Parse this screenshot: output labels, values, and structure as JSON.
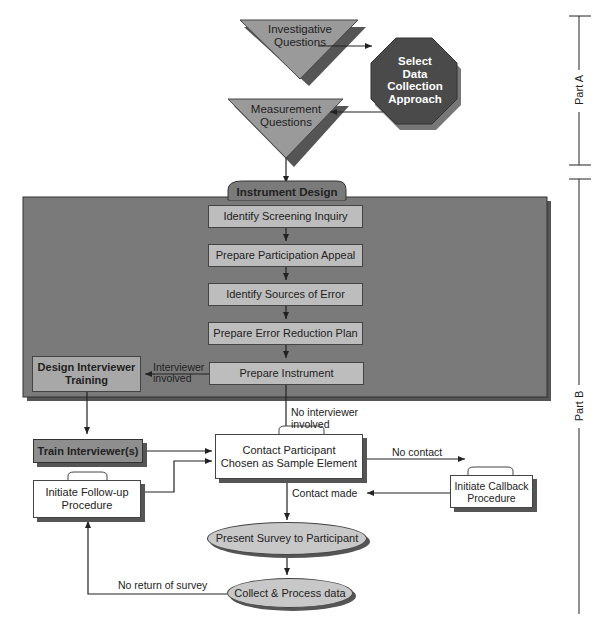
{
  "diagram": {
    "top_nodes": {
      "investigative": "Investigative\nQuestions",
      "investigative_l1": "Investigative",
      "investigative_l2": "Questions",
      "select_l1": "Select",
      "select_l2": "Data",
      "select_l3": "Collection",
      "select_l4": "Approach",
      "measurement_l1": "Measurement",
      "measurement_l2": "Questions"
    },
    "instrument_design": {
      "title": "Instrument Design",
      "steps": [
        "Identify Screening Inquiry",
        "Prepare Participation Appeal",
        "Identify Sources of Error",
        "Prepare Error Reduction Plan",
        "Prepare Instrument"
      ]
    },
    "interviewer": {
      "design_l1": "Design Interviewer",
      "design_l2": "Training",
      "train": "Train Interviewer(s)",
      "edge_label_l1": "Interviewer",
      "edge_label_l2": "involved",
      "no_interviewer_l1": "No interviewer",
      "no_interviewer_l2": "involved"
    },
    "contact": {
      "contact_l1": "Contact Participant",
      "contact_l2": "Chosen as Sample Element",
      "no_contact": "No contact",
      "contact_made": "Contact made",
      "callback_l1": "Initiate Callback",
      "callback_l2": "Procedure",
      "followup_l1": "Initiate Follow-up",
      "followup_l2": "Procedure"
    },
    "survey": {
      "present": "Present Survey to Participant",
      "collect": "Collect & Process data",
      "no_return": "No return of survey"
    },
    "parts": {
      "a": "Part A",
      "b": "Part B"
    }
  },
  "colors": {
    "panel": "#7a7a7a",
    "step_fill": "#bdbdbd",
    "octagon": "#4a4a4a",
    "triangle": "#9a9a9a",
    "ellipse": "#c8c8c8"
  }
}
